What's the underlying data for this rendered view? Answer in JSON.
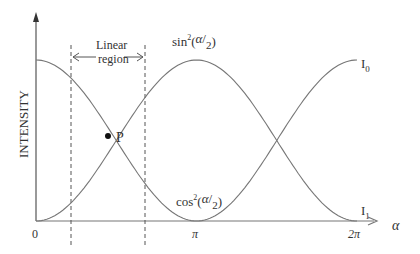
{
  "diagram": {
    "y_axis_label": "INTENSITY",
    "x_axis_label": "α",
    "x_ticks": [
      "0",
      "π",
      "2π"
    ],
    "linear_region": {
      "line1": "Linear",
      "line2": "region"
    },
    "curve_labels": {
      "sin": {
        "prefix": "sin",
        "sup": "2",
        "arg_open": "(",
        "arg_num": "α",
        "arg_den": "2",
        "arg_close": ")"
      },
      "cos": {
        "prefix": "cos",
        "sup": "2",
        "arg_open": "(",
        "arg_num": "α",
        "arg_den": "2",
        "arg_close": ")"
      },
      "I0": {
        "main": "I",
        "sub": "0"
      },
      "I1": {
        "main": "I",
        "sub": "1"
      }
    },
    "point_label": "P",
    "colors": {
      "axis": "#555555",
      "curve": "#777777",
      "text": "#333333"
    }
  },
  "chart_data": {
    "type": "line",
    "title": "",
    "xlabel": "α",
    "ylabel": "INTENSITY",
    "x_ticks": [
      "0",
      "π",
      "2π"
    ],
    "xlim": [
      0,
      6.2832
    ],
    "ylim": [
      0,
      1
    ],
    "series": [
      {
        "name": "I0 = cos²(α/2)",
        "x": [
          0,
          0.785,
          1.571,
          2.356,
          3.1416,
          3.927,
          4.712,
          5.498,
          6.2832
        ],
        "values": [
          1,
          0.854,
          0.5,
          0.146,
          0,
          0.146,
          0.5,
          0.854,
          1
        ]
      },
      {
        "name": "I1 = sin²(α/2)",
        "x": [
          0,
          0.785,
          1.571,
          2.356,
          3.1416,
          3.927,
          4.712,
          5.498,
          6.2832
        ],
        "values": [
          0,
          0.146,
          0.5,
          0.854,
          1,
          0.854,
          0.5,
          0.146,
          0
        ]
      }
    ],
    "annotations": [
      {
        "text": "P",
        "x": 1.571,
        "y": 0.5
      },
      {
        "text": "Linear region",
        "x_range": [
          0.68,
          2.13
        ]
      }
    ],
    "grid": false
  }
}
